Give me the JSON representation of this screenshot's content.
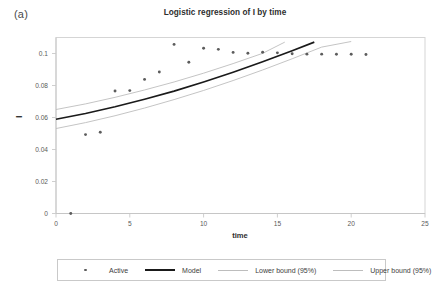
{
  "panel": {
    "label": "(a)"
  },
  "chart_data": {
    "type": "scatter",
    "title": "Logistic regression of I by time",
    "xlabel": "time",
    "ylabel": "I",
    "xlim": [
      0,
      25
    ],
    "ylim": [
      0,
      0.11
    ],
    "grid": false,
    "legend_position": "bottom",
    "xticks": [
      0,
      5,
      10,
      15,
      20,
      25
    ],
    "xtick_labels": [
      "0",
      "5",
      "10",
      "15",
      "20",
      "25"
    ],
    "yticks": [
      0,
      0.02,
      0.04,
      0.06,
      0.08,
      0.1
    ],
    "ytick_labels": [
      "0",
      "0.02",
      "0.04",
      "0.06",
      "0.08",
      "0.1"
    ],
    "series": [
      {
        "name": "Active",
        "type": "scatter",
        "marker": "dot",
        "color": "#5c5c5c",
        "x": [
          1,
          2,
          3,
          4,
          5,
          6,
          7,
          8,
          9,
          10,
          11,
          12,
          13,
          14,
          15,
          16,
          17,
          18,
          19,
          20,
          21
        ],
        "y": [
          0.0,
          0.0493,
          0.0508,
          0.0766,
          0.0768,
          0.0838,
          0.0884,
          0.1057,
          0.0945,
          0.1033,
          0.1026,
          0.1007,
          0.1002,
          0.1008,
          0.1004,
          0.0998,
          0.0996,
          0.0996,
          0.0995,
          0.0995,
          0.0994
        ]
      },
      {
        "name": "Model",
        "type": "line",
        "color": "#1a1a1a",
        "x": [
          0,
          2,
          4,
          6,
          8,
          10,
          12,
          14,
          16,
          17.5
        ],
        "y": [
          0.0589,
          0.0625,
          0.0667,
          0.0714,
          0.0765,
          0.0822,
          0.0883,
          0.0948,
          0.1017,
          0.1071
        ]
      },
      {
        "name": "Lower bound (95%)",
        "type": "line",
        "color": "#bdbdbd",
        "x": [
          0,
          2,
          4,
          6,
          8,
          10,
          12,
          14,
          16,
          18,
          20
        ],
        "y": [
          0.0531,
          0.0568,
          0.0611,
          0.0659,
          0.0712,
          0.0769,
          0.0831,
          0.0897,
          0.0967,
          0.104,
          0.1075
        ]
      },
      {
        "name": "Upper bound (95%)",
        "type": "line",
        "color": "#bdbdbd",
        "x": [
          0,
          2,
          4,
          6,
          8,
          10,
          12,
          14,
          15.5
        ],
        "y": [
          0.065,
          0.0685,
          0.0726,
          0.0772,
          0.0822,
          0.0877,
          0.0937,
          0.1001,
          0.1071
        ]
      }
    ],
    "legend_entries": [
      {
        "label": "Active",
        "key": "marker",
        "color": "#5c5c5c"
      },
      {
        "label": "Model",
        "key": "model-line",
        "color": "#1a1a1a"
      },
      {
        "label": "Lower bound (95%)",
        "key": "bound-line",
        "color": "#bdbdbd"
      },
      {
        "label": "Upper bound (95%)",
        "key": "bound-line",
        "color": "#bdbdbd"
      }
    ]
  }
}
